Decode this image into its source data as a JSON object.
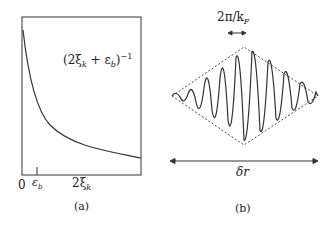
{
  "panel_a": {
    "caption": "(a)",
    "curve_label": "(2ξ",
    "curve_label_full": "(2ξk + εb)^-1",
    "label_parts": {
      "open": "(2ξ",
      "sub_k": "k",
      "plus": " + ε",
      "sub_b": "b",
      "close": ")",
      "exp": "−1"
    },
    "x_ticks": {
      "zero": "0",
      "eps": "ε",
      "eps_sub": "b",
      "xi": "2ξ",
      "xi_sub": "k"
    }
  },
  "panel_b": {
    "caption": "(b)",
    "wavelength_label": "2π/k",
    "wavelength_sub": "F",
    "width_label": "δr"
  }
}
